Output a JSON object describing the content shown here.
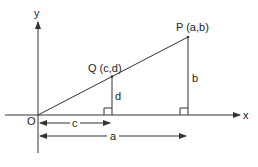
{
  "diagram": {
    "type": "coordinate-geometry",
    "colors": {
      "ink": "#333333",
      "background": "#ffffff"
    },
    "axes": {
      "x_label": "x",
      "y_label": "y",
      "origin_label": "O"
    },
    "points": [
      {
        "id": "P",
        "label": "P (a,b)"
      },
      {
        "id": "Q",
        "label": "Q (c,d)"
      }
    ],
    "segments": [
      {
        "id": "b",
        "label": "b",
        "description": "vertical from P to x-axis"
      },
      {
        "id": "d",
        "label": "d",
        "description": "vertical from Q to x-axis"
      }
    ],
    "dimensions": [
      {
        "id": "c",
        "label": "c",
        "description": "horizontal distance O to foot of Q"
      },
      {
        "id": "a",
        "label": "a",
        "description": "horizontal distance O to foot of P"
      }
    ],
    "right_angle_markers": 2
  }
}
